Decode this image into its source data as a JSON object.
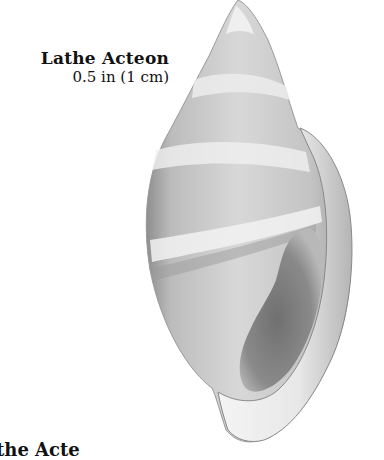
{
  "caption": {
    "name": "Lathe Acteon",
    "size": "0.5 in (1 cm)"
  },
  "bottom_caption_partial": "the Acte",
  "image": {
    "subject": "shell",
    "colors": {
      "background": "#ffffff",
      "shell_light": "#e6e6e6",
      "shell_mid": "#b8b8b8",
      "shell_dark": "#7a7a7a",
      "aperture_dark": "#6e6e6e"
    }
  }
}
